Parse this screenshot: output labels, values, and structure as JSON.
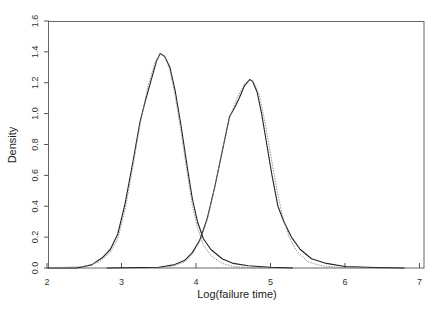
{
  "chart_data": {
    "type": "line",
    "title": "",
    "xlabel": "Log(failure time)",
    "ylabel": "Density",
    "xlim": [
      2,
      7
    ],
    "ylim": [
      0,
      1.6
    ],
    "xticks": [
      "2",
      "3",
      "4",
      "5",
      "6",
      "7"
    ],
    "yticks": [
      "0.0",
      "0.2",
      "0.4",
      "0.6",
      "0.8",
      "1.0",
      "1.2",
      "1.4",
      "1.6"
    ],
    "grid": false,
    "legend": null,
    "series": [
      {
        "name": "group-1-empirical",
        "style": "solid",
        "x": [
          2.0,
          2.4,
          2.6,
          2.75,
          2.85,
          2.95,
          3.05,
          3.15,
          3.25,
          3.32,
          3.4,
          3.47,
          3.52,
          3.58,
          3.65,
          3.72,
          3.8,
          3.88,
          3.95,
          4.02,
          4.1,
          4.2,
          4.35,
          4.5,
          4.7,
          5.0,
          5.3
        ],
        "y": [
          0.0,
          0.0,
          0.02,
          0.07,
          0.12,
          0.22,
          0.42,
          0.68,
          0.95,
          1.08,
          1.22,
          1.34,
          1.39,
          1.37,
          1.3,
          1.15,
          0.92,
          0.66,
          0.45,
          0.3,
          0.19,
          0.12,
          0.06,
          0.03,
          0.015,
          0.005,
          0.0
        ]
      },
      {
        "name": "group-1-fitted",
        "style": "dotted",
        "x": [
          2.0,
          2.5,
          2.7,
          2.85,
          2.95,
          3.05,
          3.15,
          3.25,
          3.35,
          3.45,
          3.52,
          3.58,
          3.65,
          3.72,
          3.8,
          3.88,
          3.95,
          4.02,
          4.1,
          4.2,
          4.35,
          4.5,
          4.7,
          5.0
        ],
        "y": [
          0.0,
          0.01,
          0.04,
          0.1,
          0.19,
          0.38,
          0.65,
          0.93,
          1.17,
          1.33,
          1.39,
          1.37,
          1.28,
          1.12,
          0.88,
          0.62,
          0.41,
          0.26,
          0.15,
          0.08,
          0.03,
          0.01,
          0.003,
          0.0
        ]
      },
      {
        "name": "group-2-empirical",
        "style": "solid",
        "x": [
          2.8,
          3.5,
          3.7,
          3.85,
          3.95,
          4.05,
          4.15,
          4.25,
          4.35,
          4.45,
          4.52,
          4.58,
          4.65,
          4.72,
          4.76,
          4.82,
          4.88,
          4.95,
          5.02,
          5.1,
          5.18,
          5.28,
          5.4,
          5.55,
          5.75,
          6.0,
          6.4,
          6.8
        ],
        "y": [
          0.0,
          0.005,
          0.02,
          0.05,
          0.1,
          0.18,
          0.32,
          0.52,
          0.75,
          0.98,
          1.04,
          1.1,
          1.18,
          1.22,
          1.21,
          1.14,
          1.0,
          0.8,
          0.6,
          0.4,
          0.3,
          0.2,
          0.12,
          0.06,
          0.03,
          0.01,
          0.003,
          0.0
        ]
      },
      {
        "name": "group-2-fitted",
        "style": "dotted",
        "x": [
          3.5,
          3.7,
          3.85,
          3.95,
          4.05,
          4.15,
          4.25,
          4.35,
          4.45,
          4.55,
          4.65,
          4.72,
          4.78,
          4.85,
          4.92,
          5.0,
          5.08,
          5.16,
          5.25,
          5.35,
          5.5,
          5.7,
          6.0,
          6.3
        ],
        "y": [
          0.0,
          0.015,
          0.04,
          0.09,
          0.17,
          0.31,
          0.52,
          0.76,
          0.97,
          1.1,
          1.19,
          1.22,
          1.2,
          1.12,
          0.96,
          0.74,
          0.52,
          0.34,
          0.2,
          0.11,
          0.04,
          0.012,
          0.002,
          0.0
        ]
      }
    ]
  },
  "colors": {
    "axis": "#555555",
    "solid_line": "#222222",
    "dotted_line": "#888888"
  }
}
